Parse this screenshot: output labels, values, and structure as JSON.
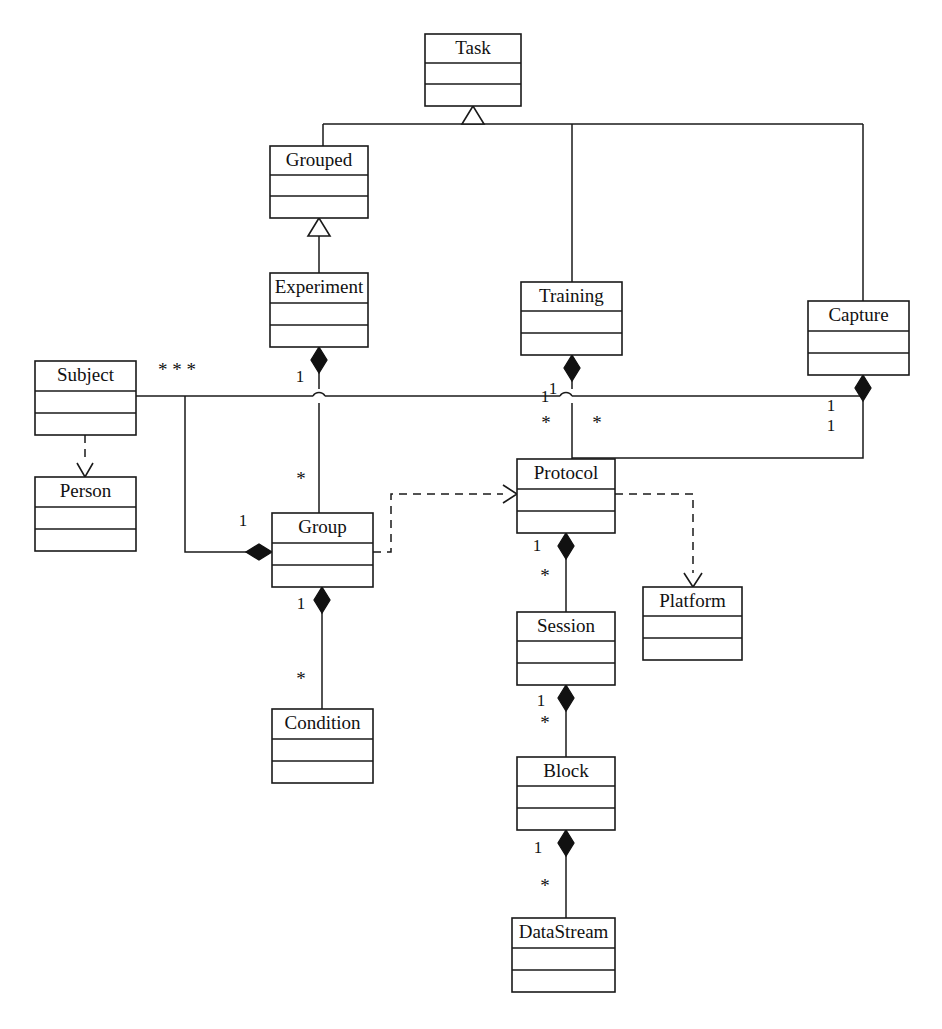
{
  "diagram": {
    "type": "uml-class-diagram",
    "title": "",
    "background_color": "#ffffff",
    "line_color": "#1a1a1a",
    "text_color": "#111111",
    "width": 942,
    "height": 1029,
    "classes": [
      {
        "id": "task",
        "name": "Task",
        "x": 425,
        "y": 34,
        "w": 96,
        "h": 72
      },
      {
        "id": "grouped",
        "name": "Grouped",
        "x": 270,
        "y": 146,
        "w": 98,
        "h": 72
      },
      {
        "id": "experiment",
        "name": "Experiment",
        "x": 270,
        "y": 273,
        "w": 98,
        "h": 74
      },
      {
        "id": "training",
        "name": "Training",
        "x": 521,
        "y": 282,
        "w": 101,
        "h": 73
      },
      {
        "id": "capture",
        "name": "Capture",
        "x": 808,
        "y": 301,
        "w": 101,
        "h": 74
      },
      {
        "id": "subject",
        "name": "Subject",
        "x": 35,
        "y": 361,
        "w": 101,
        "h": 74
      },
      {
        "id": "person",
        "name": "Person",
        "x": 35,
        "y": 477,
        "w": 101,
        "h": 74
      },
      {
        "id": "protocol",
        "name": "Protocol",
        "x": 517,
        "y": 459,
        "w": 98,
        "h": 74
      },
      {
        "id": "group",
        "name": "Group",
        "x": 272,
        "y": 513,
        "w": 101,
        "h": 74
      },
      {
        "id": "platform",
        "name": "Platform",
        "x": 643,
        "y": 587,
        "w": 99,
        "h": 73
      },
      {
        "id": "session",
        "name": "Session",
        "x": 517,
        "y": 612,
        "w": 98,
        "h": 73
      },
      {
        "id": "condition",
        "name": "Condition",
        "x": 272,
        "y": 709,
        "w": 101,
        "h": 74
      },
      {
        "id": "block",
        "name": "Block",
        "x": 517,
        "y": 757,
        "w": 98,
        "h": 73
      },
      {
        "id": "datastream",
        "name": "DataStream",
        "x": 512,
        "y": 918,
        "w": 103,
        "h": 74
      }
    ],
    "relationships": [
      {
        "id": "grouped-task",
        "from": "grouped",
        "to": "task",
        "kind": "generalization"
      },
      {
        "id": "training-task",
        "from": "training",
        "to": "task",
        "kind": "generalization"
      },
      {
        "id": "capture-task",
        "from": "capture",
        "to": "task",
        "kind": "generalization"
      },
      {
        "id": "experiment-grouped",
        "from": "experiment",
        "to": "grouped",
        "kind": "generalization"
      },
      {
        "id": "subject-person",
        "from": "subject",
        "to": "person",
        "kind": "dependency"
      },
      {
        "id": "group-protocol",
        "from": "group",
        "to": "protocol",
        "kind": "dependency"
      },
      {
        "id": "protocol-platform",
        "from": "protocol",
        "to": "platform",
        "kind": "dependency"
      },
      {
        "id": "experiment-group",
        "from": "experiment",
        "to": "group",
        "kind": "composition",
        "source_mult": "1",
        "target_mult": "*"
      },
      {
        "id": "subject-group",
        "from": "subject",
        "to": "group",
        "kind": "composition",
        "source_mult": "* * *",
        "target_mult": "1"
      },
      {
        "id": "group-condition",
        "from": "group",
        "to": "condition",
        "kind": "composition",
        "source_mult": "1",
        "target_mult": "*"
      },
      {
        "id": "training-protocol",
        "from": "training",
        "to": "protocol",
        "kind": "composition",
        "source_mult": "1",
        "target_mult": "*"
      },
      {
        "id": "capture-protocol",
        "from": "capture",
        "to": "protocol",
        "kind": "composition",
        "source_mult": "1",
        "target_mult": "*"
      },
      {
        "id": "capture-subject",
        "from": "capture",
        "to": "subject",
        "kind": "composition",
        "source_mult": "1",
        "target_mult": "1"
      },
      {
        "id": "protocol-session",
        "from": "protocol",
        "to": "session",
        "kind": "composition",
        "source_mult": "1",
        "target_mult": "*"
      },
      {
        "id": "session-block",
        "from": "session",
        "to": "block",
        "kind": "composition",
        "source_mult": "1",
        "target_mult": "*"
      },
      {
        "id": "block-datastream",
        "from": "block",
        "to": "datastream",
        "kind": "composition",
        "source_mult": "1",
        "target_mult": "*"
      }
    ],
    "multiplicity_labels": [
      {
        "id": "m-subject-stars",
        "text": "* * *",
        "x": 177,
        "y": 372
      },
      {
        "id": "m-experiment-group-1",
        "text": "1",
        "x": 300,
        "y": 378
      },
      {
        "id": "m-experiment-group-star",
        "text": "*",
        "x": 301,
        "y": 481
      },
      {
        "id": "m-training-proto-1a",
        "text": "1",
        "x": 553,
        "y": 390
      },
      {
        "id": "m-training-proto-1b",
        "text": "1",
        "x": 545,
        "y": 398
      },
      {
        "id": "m-training-proto-star",
        "text": "*",
        "x": 546,
        "y": 425
      },
      {
        "id": "m-capture-proto-star",
        "text": "*",
        "x": 597,
        "y": 425
      },
      {
        "id": "m-capture-1a",
        "text": "1",
        "x": 831,
        "y": 407
      },
      {
        "id": "m-capture-1b",
        "text": "1",
        "x": 831,
        "y": 427
      },
      {
        "id": "m-subject-group-1",
        "text": "1",
        "x": 243,
        "y": 522
      },
      {
        "id": "m-protocol-session-1",
        "text": "1",
        "x": 537,
        "y": 547
      },
      {
        "id": "m-protocol-session-star",
        "text": "*",
        "x": 545,
        "y": 578
      },
      {
        "id": "m-group-cond-1",
        "text": "1",
        "x": 301,
        "y": 605
      },
      {
        "id": "m-group-cond-star",
        "text": "*",
        "x": 301,
        "y": 681
      },
      {
        "id": "m-session-block-1",
        "text": "1",
        "x": 541,
        "y": 702
      },
      {
        "id": "m-session-block-star",
        "text": "*",
        "x": 545,
        "y": 725
      },
      {
        "id": "m-block-ds-1",
        "text": "1",
        "x": 538,
        "y": 849
      },
      {
        "id": "m-block-ds-star",
        "text": "*",
        "x": 545,
        "y": 888
      }
    ]
  }
}
